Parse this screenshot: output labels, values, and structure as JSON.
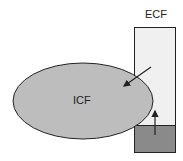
{
  "labels": {
    "ecf": "ECF",
    "icf": "ICF"
  },
  "colors": {
    "ecf_light": "#f0f0f0",
    "ecf_dark": "#8a8a8a",
    "icf_fill": "#bdbdbd",
    "stroke": "#222222"
  }
}
